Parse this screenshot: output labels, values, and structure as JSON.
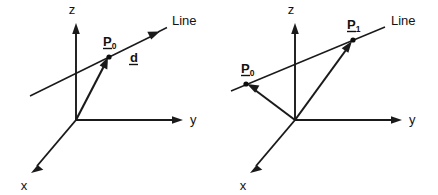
{
  "figure": {
    "background_color": "#ffffff",
    "ink_color": "#1a1a1a",
    "panel_count": 2
  },
  "panels": [
    {
      "id": "left-panel",
      "caption": "Line through point P0 with direction vector d",
      "axes": [
        {
          "name": "z-axis",
          "label": "z",
          "direction": "up"
        },
        {
          "name": "y-axis",
          "label": "y",
          "direction": "right"
        },
        {
          "name": "x-axis",
          "label": "x",
          "direction": "down-left"
        }
      ],
      "line_label": "Line",
      "points": [
        {
          "name": "point-p0",
          "label": "P",
          "subscript": "0",
          "underlined": true
        }
      ],
      "vectors": [
        {
          "name": "direction-vector-d",
          "label": "d",
          "subscript": "",
          "underlined": true
        },
        {
          "name": "position-vector-p0",
          "label": "",
          "subscript": "",
          "underlined": false
        }
      ]
    },
    {
      "id": "right-panel",
      "caption": "Line through two points P0 and P1",
      "axes": [
        {
          "name": "z-axis",
          "label": "z",
          "direction": "up"
        },
        {
          "name": "y-axis",
          "label": "y",
          "direction": "right"
        },
        {
          "name": "x-axis",
          "label": "x",
          "direction": "down-left"
        }
      ],
      "line_label": "Line",
      "points": [
        {
          "name": "point-p0",
          "label": "P",
          "subscript": "0",
          "underlined": true
        },
        {
          "name": "point-p1",
          "label": "P",
          "subscript": "1",
          "underlined": true
        }
      ],
      "vectors": [
        {
          "name": "position-vector-p0",
          "label": "",
          "subscript": "",
          "underlined": false
        },
        {
          "name": "position-vector-p1",
          "label": "",
          "subscript": "",
          "underlined": false
        }
      ]
    }
  ],
  "labels": {
    "z": "z",
    "y": "y",
    "x": "x",
    "line": "Line",
    "P": "P",
    "sub0": "0",
    "sub1": "1",
    "d": "d"
  }
}
